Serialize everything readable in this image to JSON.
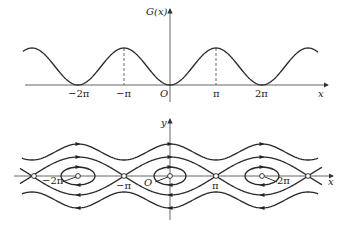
{
  "top_plot": {
    "y_label": "G(x)",
    "x_label": "x",
    "origin_label": "O",
    "tick_labels": [
      "−2π",
      "−π",
      "π",
      "2π"
    ],
    "curve": "G(x) = 1 − cos x (periodic, minima at 2kπ, maxima at (2k+1)π)"
  },
  "bottom_plot": {
    "y_label": "y",
    "x_label": "x",
    "origin_label": "O",
    "tick_labels": [
      "−2π",
      "−π",
      "π",
      "2π"
    ],
    "description": "Phase portrait: centers at 2kπ, saddles at (2k+1)π, with closed orbits, separatrices and rotating trajectories"
  },
  "colors": {
    "line": "#2a2a2a",
    "axis": "#555555"
  }
}
